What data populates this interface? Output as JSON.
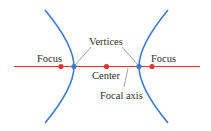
{
  "diagram": {
    "type": "hyperbola",
    "labels": {
      "focus_left": "Focus",
      "focus_right": "Focus",
      "vertices": "Vertices",
      "center": "Center",
      "focal_axis": "Focal axis"
    },
    "colors": {
      "curve": "#3b7bcb",
      "axis": "#e3342c",
      "focus_point": "#e3342c",
      "center_point": "#e3342c",
      "vertex_point": "#3b7bcb",
      "leader_line": "#8a8a8a",
      "text": "#2e2e2e"
    }
  }
}
